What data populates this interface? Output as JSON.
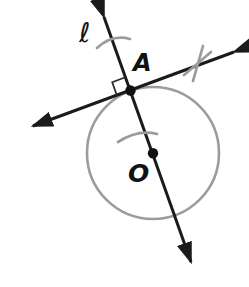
{
  "diagram": {
    "type": "geometry-circle-tangent",
    "labels": {
      "line_label": "ℓ",
      "tangent_point_label": "A",
      "center_label": "O"
    },
    "colors": {
      "line_black": "#1b1b1b",
      "circle_gray": "#9c9c9c",
      "background": "#ffffff",
      "point_dot": "#111111"
    },
    "elements": {
      "circle": "circle centered at O passing through A",
      "secant_line": "line ℓ through A and center O, arrows both ends, two single tick marks",
      "tangent_line": "line through A perpendicular to secant, arrows both ends, X mark on right arm",
      "right_angle_marker": "small square at A between the two lines",
      "points": [
        "A on circle",
        "O center"
      ]
    }
  }
}
